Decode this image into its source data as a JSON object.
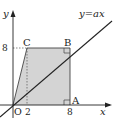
{
  "diagram": {
    "type": "coordinate-geometry",
    "axes": {
      "x_label": "x",
      "y_label": "y",
      "origin_label": "O"
    },
    "ticks": {
      "x": [
        "2",
        "8"
      ],
      "y": [
        "8"
      ]
    },
    "points": [
      {
        "name": "A",
        "label": "A",
        "coords": [
          8,
          0
        ]
      },
      {
        "name": "B",
        "label": "B",
        "coords": [
          8,
          8
        ]
      },
      {
        "name": "C",
        "label": "C",
        "coords": [
          2,
          8
        ]
      },
      {
        "name": "O",
        "label": "O",
        "coords": [
          0,
          0
        ]
      }
    ],
    "line": {
      "label": "y=ax"
    },
    "shaded_region": "OABC",
    "colors": {
      "shade": "#d4d4d4",
      "stroke": "#222222"
    }
  }
}
